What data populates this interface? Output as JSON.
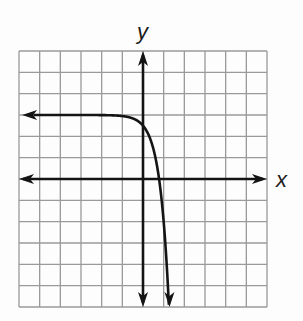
{
  "labels": {
    "x_axis": "x",
    "y_axis": "y"
  },
  "colors": {
    "grid": "#9a9a9a",
    "axis": "#141414",
    "curve": "#141414",
    "background": "#fdfdfd"
  },
  "chart_data": {
    "type": "line",
    "title": "",
    "xlabel": "x",
    "ylabel": "y",
    "xlim": [
      -6,
      6
    ],
    "ylim": [
      -6,
      6
    ],
    "grid": true,
    "tick_labels": false,
    "series": [
      {
        "name": "exponential curve",
        "description": "decreasing exponential with horizontal asymptote y = 3 on the left, falling steeply to the bottom near x ≈ 1.3",
        "asymptote_y": 3,
        "y_intercept": 2.5,
        "x_intercept": 0.8,
        "x": [
          -6,
          -3,
          -2,
          -1,
          -0.5,
          0,
          0.25,
          0.5,
          0.75,
          1.0,
          1.1,
          1.2,
          1.26
        ],
        "y": [
          3,
          3,
          2.995,
          2.95,
          2.84,
          2.5,
          2.11,
          1.42,
          0.19,
          -2.0,
          -3.29,
          -4.92,
          -6
        ]
      }
    ]
  }
}
